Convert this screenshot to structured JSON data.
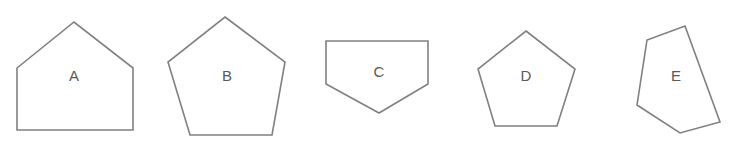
{
  "figure": {
    "background_color": "#ffffff",
    "stroke_color": "#808080",
    "label_color": "#595959",
    "stroke_width": 1.6,
    "width": 732,
    "height": 152
  },
  "shapes": [
    {
      "label": "A",
      "name": "house-pentagon",
      "description": "House-shaped pentagon with rectangular base and triangular roof",
      "points": "17,68 74,22 133,68 133,130 17,130",
      "label_x": 74,
      "label_y": 77
    },
    {
      "label": "B",
      "name": "regular-pentagon-large",
      "description": "Regular pentagon, point up",
      "points": "225,17 285,62 272,135 190,135 168,62",
      "label_x": 227,
      "label_y": 77
    },
    {
      "label": "C",
      "name": "home-plate-pentagon",
      "description": "Inverted house pentagon, point down",
      "points": "326,41 428,41 428,84 379,113 326,84",
      "label_x": 379,
      "label_y": 73
    },
    {
      "label": "D",
      "name": "regular-pentagon-small",
      "description": "Regular pentagon, point up, smaller",
      "points": "526,31 575,69 557,126 495,126 478,69",
      "label_x": 526,
      "label_y": 77
    },
    {
      "label": "E",
      "name": "irregular-pentagon-tilted",
      "description": "Irregular tilted pentagon",
      "points": "685,26 720,122 680,133 637,105 647,40",
      "label_x": 676,
      "label_y": 77
    }
  ]
}
